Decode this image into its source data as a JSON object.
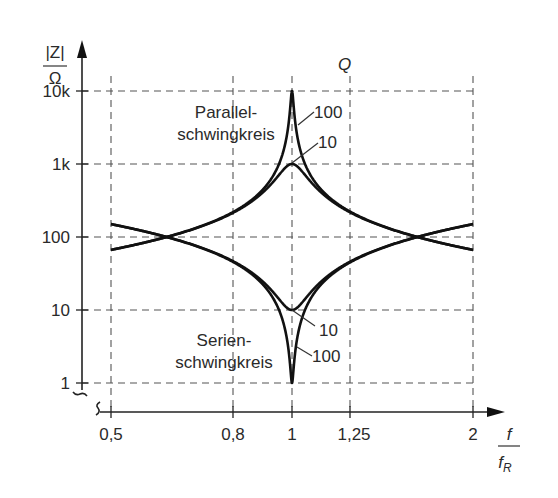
{
  "chart_data": {
    "type": "line",
    "title": "",
    "xlabel": "f / f_R",
    "ylabel": "|Z| / Ω",
    "x_scale": "log",
    "y_scale": "log",
    "xlim": [
      0.5,
      2
    ],
    "ylim": [
      1,
      10000
    ],
    "grid": true,
    "x_ticks": [
      0.5,
      0.8,
      1,
      1.25,
      2
    ],
    "x_tick_labels": [
      "0,5",
      "0,8",
      "1",
      "1,25",
      "2"
    ],
    "y_ticks": [
      1,
      10,
      100,
      1000,
      10000
    ],
    "y_tick_labels": [
      "1",
      "10",
      "100",
      "1k",
      "10k"
    ],
    "characteristic_impedance": 100,
    "series": [
      {
        "name": "Parallelschwingkreis Q=100",
        "circuit": "parallel",
        "Q": 100,
        "peak": 10000,
        "x": [
          0.5,
          0.8,
          0.9,
          0.95,
          0.99,
          1,
          1.01,
          1.05,
          1.11,
          1.25,
          2
        ],
        "values": [
          66.7,
          222,
          474,
          975,
          4470,
          10000,
          4470,
          975,
          474,
          222,
          66.7
        ]
      },
      {
        "name": "Parallelschwingkreis Q=10",
        "circuit": "parallel",
        "Q": 10,
        "peak": 1000,
        "x": [
          0.5,
          0.8,
          0.9,
          0.95,
          1,
          1.05,
          1.11,
          1.25,
          2
        ],
        "values": [
          66.7,
          216,
          429,
          699,
          1000,
          699,
          429,
          216,
          66.7
        ]
      },
      {
        "name": "Serienschwingkreis Q=10",
        "circuit": "series",
        "Q": 10,
        "min": 10,
        "x": [
          0.5,
          0.8,
          0.9,
          0.95,
          1,
          1.05,
          1.11,
          1.25,
          2
        ],
        "values": [
          150,
          46.1,
          23.3,
          14.3,
          10,
          14.3,
          23.3,
          46.1,
          150
        ]
      },
      {
        "name": "Serienschwingkreis Q=100",
        "circuit": "series",
        "Q": 100,
        "min": 1,
        "x": [
          0.5,
          0.8,
          0.9,
          0.95,
          0.99,
          1,
          1.01,
          1.05,
          1.11,
          1.25,
          2
        ],
        "values": [
          150,
          45,
          21.1,
          10.3,
          2.24,
          1,
          2.24,
          10.3,
          21.1,
          45,
          150
        ]
      }
    ],
    "annotations": [
      "Parallel-",
      "schwingkreis",
      "Serien-",
      "schwingkreis",
      "Q",
      "100",
      "10",
      "10",
      "100"
    ]
  },
  "labels": {
    "y_num": "|Z|",
    "y_den": "Ω",
    "x_num": "f",
    "x_den": "f",
    "x_den_sub": "R",
    "q_header": "Q",
    "parallel_line1": "Parallel-",
    "parallel_line2": "schwingkreis",
    "series_line1": "Serien-",
    "series_line2": "schwingkreis",
    "par_q100": "100",
    "par_q10": "10",
    "ser_q10": "10",
    "ser_q100": "100"
  },
  "ticks": {
    "y": [
      "10k",
      "1k",
      "100",
      "10",
      "1"
    ],
    "x": [
      "0,5",
      "0,8",
      "1",
      "1,25",
      "2"
    ]
  }
}
